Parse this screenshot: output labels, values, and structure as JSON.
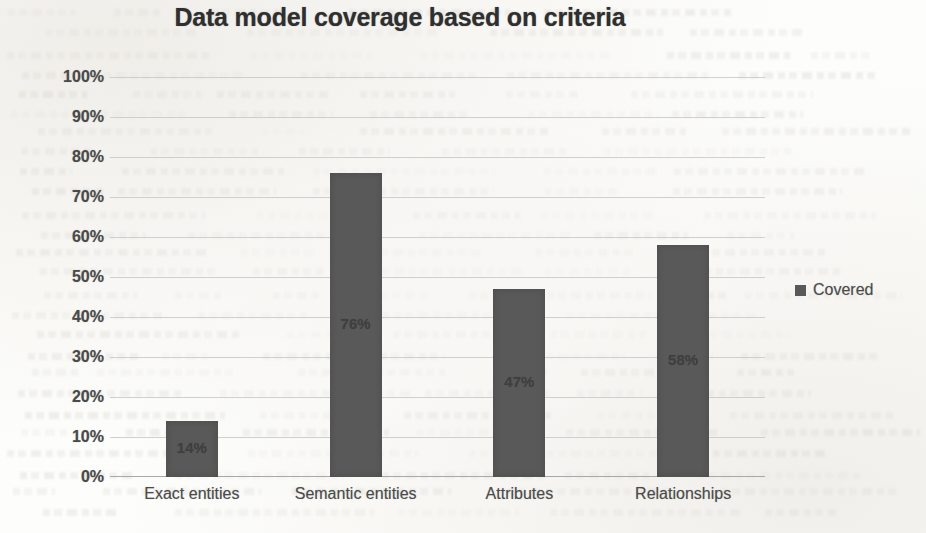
{
  "chart_data": {
    "type": "bar",
    "title": "Data model coverage based on criteria",
    "xlabel": "",
    "ylabel": "",
    "categories": [
      "Exact entities",
      "Semantic entities",
      "Attributes",
      "Relationships"
    ],
    "values": [
      14,
      76,
      47,
      58
    ],
    "data_labels": [
      "14%",
      "76%",
      "47%",
      "58%"
    ],
    "series": [
      {
        "name": "Covered",
        "values": [
          14,
          76,
          47,
          58
        ],
        "color": "#595959"
      }
    ],
    "ylim": [
      0,
      100
    ],
    "y_ticks": [
      100,
      90,
      80,
      70,
      60,
      50,
      40,
      30,
      20,
      10,
      0
    ],
    "y_tick_labels": [
      "100%",
      "90%",
      "80%",
      "70%",
      "60%",
      "50%",
      "40%",
      "30%",
      "20%",
      "10%",
      "0%"
    ],
    "grid": true,
    "legend_position": "right",
    "legend": [
      {
        "label": "Covered",
        "color": "#595959",
        "marker": "square"
      }
    ]
  },
  "legend": {
    "entry_label": "Covered"
  }
}
